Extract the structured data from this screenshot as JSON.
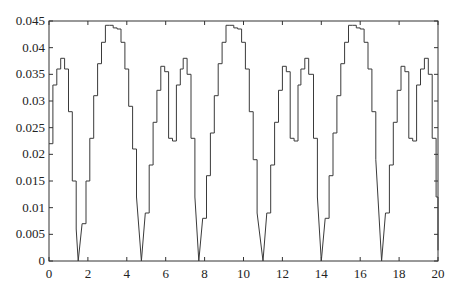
{
  "chart_data": {
    "type": "line",
    "title": "",
    "xlabel": "",
    "ylabel": "",
    "xlim": [
      0,
      20
    ],
    "ylim": [
      0,
      0.045
    ],
    "grid": false,
    "legend": null,
    "step": true,
    "x_ticks": [
      0,
      2,
      4,
      6,
      8,
      10,
      12,
      14,
      16,
      18,
      20
    ],
    "x_tick_labels": [
      "0",
      "2",
      "4",
      "6",
      "8",
      "10",
      "12",
      "14",
      "16",
      "18",
      "20"
    ],
    "y_ticks": [
      0,
      0.005,
      0.01,
      0.015,
      0.02,
      0.025,
      0.03,
      0.035,
      0.04,
      0.045
    ],
    "y_tick_labels": [
      "0",
      "0.005",
      "0.01",
      "0.015",
      "0.02",
      "0.025",
      "0.03",
      "0.035",
      "0.04",
      "0.045"
    ],
    "series": [
      {
        "name": "signal",
        "color": "#3a3a3a",
        "x": [
          0.0,
          0.2,
          0.4,
          0.6,
          0.8,
          1.0,
          1.2,
          1.4,
          1.5,
          1.7,
          1.9,
          2.1,
          2.3,
          2.5,
          2.7,
          2.9,
          3.1,
          3.3,
          3.5,
          3.7,
          3.9,
          4.1,
          4.3,
          4.5,
          4.75,
          4.95,
          5.15,
          5.35,
          5.55,
          5.75,
          5.95,
          6.15,
          6.35,
          6.55,
          6.75,
          6.9,
          7.1,
          7.3,
          7.5,
          7.7,
          7.9,
          8.1,
          8.3,
          8.5,
          8.7,
          8.9,
          9.1,
          9.3,
          9.5,
          9.7,
          9.9,
          10.1,
          10.3,
          10.5,
          10.7,
          11.0,
          11.2,
          11.4,
          11.6,
          11.8,
          12.0,
          12.2,
          12.4,
          12.6,
          12.8,
          12.95,
          13.15,
          13.35,
          13.6,
          13.8,
          14.0,
          14.2,
          14.4,
          14.6,
          14.8,
          15.0,
          15.2,
          15.4,
          15.6,
          15.8,
          16.0,
          16.2,
          16.4,
          16.6,
          16.8,
          17.1,
          17.3,
          17.5,
          17.7,
          17.9,
          18.1,
          18.3,
          18.5,
          18.7,
          18.9,
          19.1,
          19.3,
          19.5,
          19.7,
          19.9,
          20.0
        ],
        "y": [
          0.022,
          0.033,
          0.036,
          0.038,
          0.036,
          0.028,
          0.015,
          0.006,
          0.0,
          0.007,
          0.015,
          0.023,
          0.031,
          0.037,
          0.041,
          0.0442,
          0.0442,
          0.0437,
          0.0435,
          0.041,
          0.036,
          0.029,
          0.021,
          0.012,
          0.0,
          0.009,
          0.018,
          0.026,
          0.032,
          0.0365,
          0.0355,
          0.023,
          0.0225,
          0.033,
          0.036,
          0.038,
          0.035,
          0.023,
          0.012,
          0.0,
          0.008,
          0.016,
          0.024,
          0.031,
          0.037,
          0.041,
          0.0442,
          0.0442,
          0.0437,
          0.0435,
          0.041,
          0.036,
          0.028,
          0.019,
          0.009,
          0.0,
          0.009,
          0.018,
          0.026,
          0.032,
          0.0365,
          0.0355,
          0.023,
          0.0225,
          0.033,
          0.036,
          0.038,
          0.035,
          0.023,
          0.012,
          0.0,
          0.008,
          0.016,
          0.024,
          0.031,
          0.037,
          0.041,
          0.0442,
          0.0442,
          0.0437,
          0.0435,
          0.041,
          0.036,
          0.028,
          0.019,
          0.0,
          0.009,
          0.018,
          0.026,
          0.032,
          0.0365,
          0.0355,
          0.023,
          0.0225,
          0.033,
          0.036,
          0.038,
          0.035,
          0.023,
          0.012,
          0.002
        ]
      }
    ],
    "annotations": {
      "zero_crossings": [
        1.5,
        4.75,
        7.7,
        11.0,
        14.0,
        17.1
      ],
      "major_peaks": [
        {
          "x": 3.1,
          "y": 0.0442
        },
        {
          "x": 9.2,
          "y": 0.0442
        },
        {
          "x": 15.4,
          "y": 0.0442
        }
      ],
      "minor_peaks": [
        {
          "x": 0.6,
          "y": 0.038
        },
        {
          "x": 6.9,
          "y": 0.038
        },
        {
          "x": 12.95,
          "y": 0.038
        },
        {
          "x": 19.3,
          "y": 0.038
        }
      ]
    }
  }
}
